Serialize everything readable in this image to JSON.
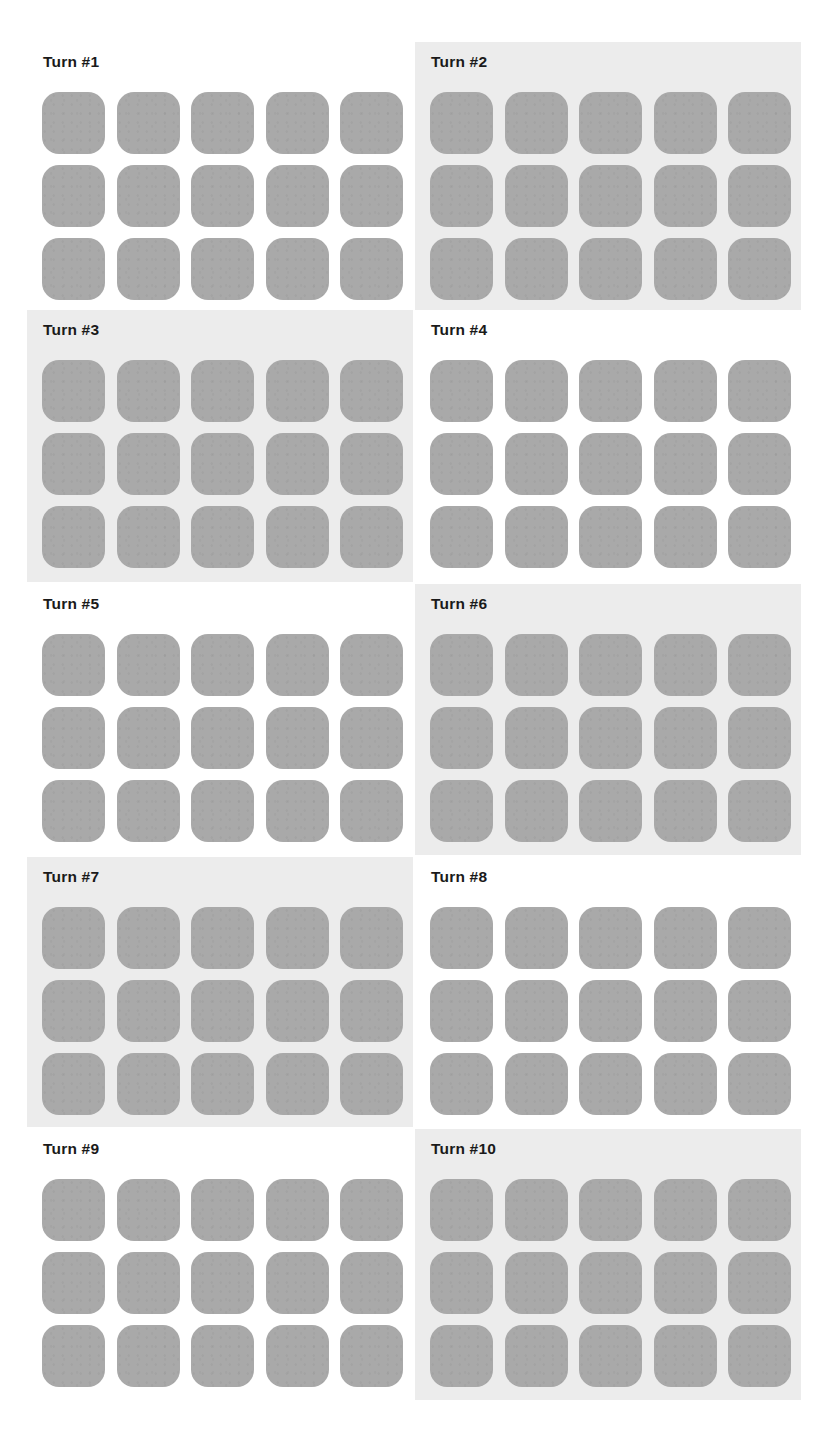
{
  "layout": {
    "columns": 2,
    "rows": 5,
    "tiles_per_panel": {
      "rows": 3,
      "cols": 5
    }
  },
  "colors": {
    "page_background": "#ffffff",
    "tinted_panel_background": "#ececec",
    "tile_fill": "#a9a9a9",
    "title_text": "#1a1a1a"
  },
  "panels": [
    {
      "title": "Turn #1",
      "tinted": false,
      "tiles": 15
    },
    {
      "title": "Turn #2",
      "tinted": true,
      "tiles": 15
    },
    {
      "title": "Turn #3",
      "tinted": true,
      "tiles": 15
    },
    {
      "title": "Turn #4",
      "tinted": false,
      "tiles": 15
    },
    {
      "title": "Turn #5",
      "tinted": false,
      "tiles": 15
    },
    {
      "title": "Turn #6",
      "tinted": true,
      "tiles": 15
    },
    {
      "title": "Turn #7",
      "tinted": true,
      "tiles": 15
    },
    {
      "title": "Turn #8",
      "tinted": false,
      "tiles": 15
    },
    {
      "title": "Turn #9",
      "tinted": false,
      "tiles": 15
    },
    {
      "title": "Turn #10",
      "tinted": true,
      "tiles": 15
    }
  ]
}
